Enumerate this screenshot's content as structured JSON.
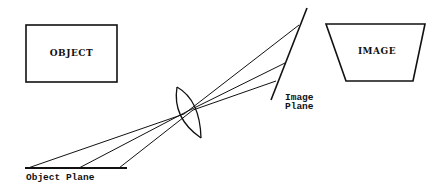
{
  "diagram": {
    "object_box": {
      "label": "OBJECT"
    },
    "image_box": {
      "label": "IMAGE"
    },
    "object_plane": {
      "label": "Object Plane"
    },
    "image_plane": {
      "label_line1": "Image",
      "label_line2": "Plane"
    },
    "lens": {
      "name": "lens"
    },
    "rays": [
      {
        "from": "object-plane-left",
        "to": "image-plane-top"
      },
      {
        "from": "object-plane-middle",
        "to": "image-plane-middle"
      },
      {
        "from": "object-plane-right",
        "to": "image-plane-bottom"
      }
    ],
    "colors": {
      "stroke": "#111111",
      "background": "#ffffff"
    }
  }
}
